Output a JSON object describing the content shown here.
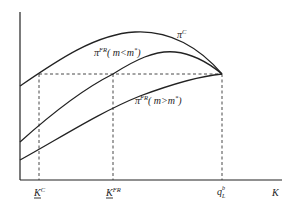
{
  "diagram": {
    "type": "profit-capacity curves",
    "axes": {
      "x_label": "K",
      "y_label": ""
    },
    "curves": [
      {
        "id": "pi_c",
        "label_main": "π",
        "label_sup": "C",
        "label_rest": ""
      },
      {
        "id": "pi_fr_lt",
        "label_main": "π",
        "label_sup": "FR",
        "label_rest": "( m<m",
        "label_sup2": "*",
        "label_end": ")"
      },
      {
        "id": "pi_fr_gt",
        "label_main": "π",
        "label_sup": "FR",
        "label_rest": "( m>m",
        "label_sup2": "*",
        "label_end": ")"
      }
    ],
    "x_ticks": [
      {
        "id": "k_c",
        "main": "K",
        "sup": "C",
        "underline": true
      },
      {
        "id": "k_fr",
        "main": "K",
        "sup": "FR",
        "underline": true
      },
      {
        "id": "q_l_b",
        "main": "q",
        "sup": "b",
        "sub": "L",
        "underline": false
      }
    ],
    "colors": {
      "line": "#222222",
      "background": "#ffffff"
    }
  }
}
